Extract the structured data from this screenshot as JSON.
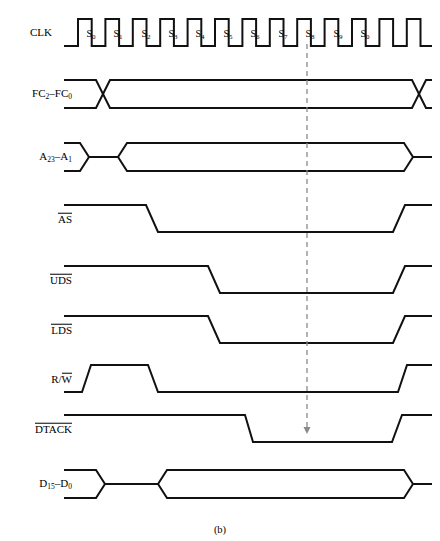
{
  "figure": {
    "caption": "(b)",
    "caption_y": 524,
    "width": 440,
    "height": 541,
    "line_color": "#111111",
    "dashed_color": "#8a8a8a",
    "background": "#ffffff"
  },
  "clock": {
    "name": "CLK",
    "label_x": 52,
    "label_y": 33,
    "state_labels": [
      "S0",
      "S1",
      "S2",
      "S3",
      "S4",
      "S5",
      "S6",
      "S7",
      "S8",
      "S9",
      "S0"
    ],
    "state_label_y": 33,
    "state_label_x": [
      91,
      118,
      146,
      173,
      200,
      228,
      255,
      283,
      310,
      338,
      365
    ],
    "high_y": 19,
    "low_y": 46,
    "start_x": 64,
    "end_x": 432,
    "first_rise_x": 78,
    "half_period": 13.7
  },
  "marker": {
    "name": "S7-reference-marker",
    "x": 307,
    "y_top": 44,
    "y_bottom": 434,
    "arrow_half_width": 3.5,
    "arrow_length": 7
  },
  "signals": [
    {
      "name": "FC2-FC0",
      "label_html": "FC<sub>2</sub>–FC<sub>0</sub>",
      "label_x": 72,
      "kind": "bus-cross",
      "center_y": 94,
      "high_y": 80,
      "low_y": 108,
      "start_x": 64,
      "end_x": 432,
      "cross_left_x": 96,
      "cross_right_x": 412,
      "cross_width": 14
    },
    {
      "name": "A23-A1",
      "label_html": "A<sub>23</sub>–A<sub>1</sub>",
      "label_x": 72,
      "kind": "bus-pinch",
      "center_y": 157,
      "high_y": 143,
      "low_y": 171,
      "start_x": 64,
      "end_x": 432,
      "pinch_start_x": 80,
      "pinch_end_x": 112,
      "valid_start_x": 118,
      "valid_end_x": 404,
      "taper": 9
    },
    {
      "name": "AS",
      "label_html": "<span class=\"ovl\">AS</span>",
      "label_x": 72,
      "kind": "active-low",
      "high_y": 205,
      "low_y": 232,
      "start_x": 64,
      "end_x": 432,
      "fall_start_x": 146,
      "fall_end_x": 158,
      "rise_start_x": 393,
      "rise_end_x": 405
    },
    {
      "name": "UDS",
      "label_html": "<span class=\"ovl\">UDS</span>",
      "label_x": 72,
      "kind": "active-low",
      "high_y": 266,
      "low_y": 293,
      "start_x": 64,
      "end_x": 432,
      "fall_start_x": 208,
      "fall_end_x": 220,
      "rise_start_x": 393,
      "rise_end_x": 405
    },
    {
      "name": "LDS",
      "label_html": "<span class=\"ovl\">LDS</span>",
      "label_x": 72,
      "kind": "active-low",
      "high_y": 316,
      "low_y": 343,
      "start_x": 64,
      "end_x": 432,
      "fall_start_x": 208,
      "fall_end_x": 220,
      "rise_start_x": 393,
      "rise_end_x": 405
    },
    {
      "name": "R/W",
      "label_html": "R/<span class=\"ovl\">W</span>",
      "label_x": 72,
      "kind": "rw-pulse",
      "high_y": 365,
      "low_y": 392,
      "start_x": 64,
      "end_x": 432,
      "rise1_start_x": 82,
      "rise1_end_x": 91,
      "fall1_start_x": 148,
      "fall1_end_x": 158,
      "rise2_start_x": 398,
      "rise2_end_x": 407
    },
    {
      "name": "DTACK",
      "label_html": "<span class=\"ovl\">DTACK</span>",
      "label_x": 72,
      "kind": "active-low",
      "high_y": 415,
      "low_y": 442,
      "start_x": 64,
      "end_x": 432,
      "fall_start_x": 245,
      "fall_end_x": 253,
      "rise_start_x": 392,
      "rise_end_x": 402
    },
    {
      "name": "D15-D0",
      "label_html": "D<sub>15</sub>–D<sub>0</sub>",
      "label_x": 72,
      "kind": "bus-pinch",
      "center_y": 484,
      "high_y": 470,
      "low_y": 498,
      "start_x": 64,
      "end_x": 432,
      "pinch_start_x": 96,
      "pinch_end_x": 152,
      "valid_start_x": 158,
      "valid_end_x": 404,
      "taper": 9
    }
  ]
}
